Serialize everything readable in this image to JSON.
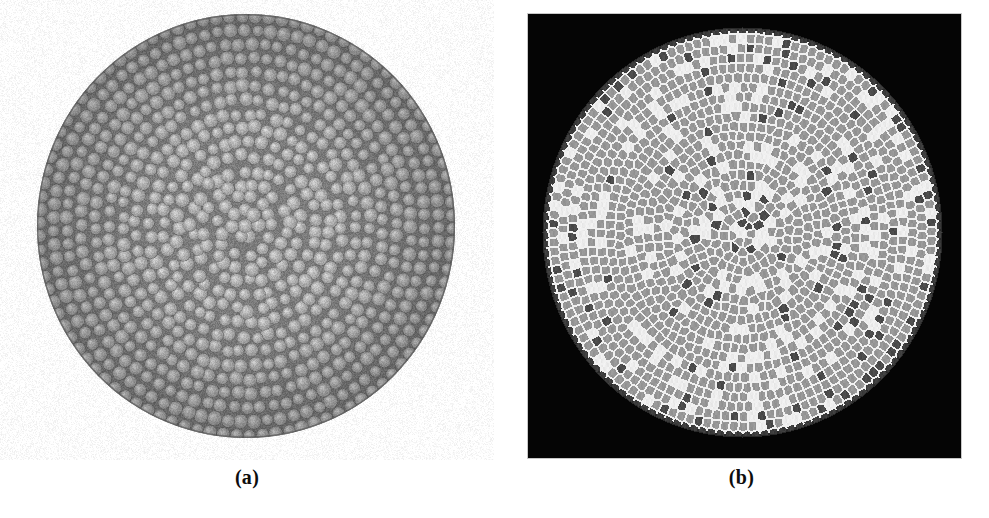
{
  "figure": {
    "background_color": "#ffffff",
    "width": 989,
    "height": 518
  },
  "panels": [
    {
      "id": "a",
      "caption": "(a)",
      "kind": "photograph",
      "description": "Grayscale micrograph of a monodisperse disc packing confined in a circular cell",
      "background_color": "#ffffff",
      "circle": {
        "cx": 246,
        "cy": 226,
        "rx": 209,
        "ry": 212
      },
      "disc": {
        "mean_radius": 6.6,
        "radius_jitter": 0.55,
        "fill_color": "#b4b4b4",
        "highlight_color": "#d2d2d2",
        "gap_color": "#6e6e6e",
        "edge_color": "#5a5a5a"
      },
      "matrix_color": "#7c7c7c",
      "rim_color": "#616161",
      "count_estimate": 2400,
      "shell_count": 16,
      "vignette_opacity": 0.18
    },
    {
      "id": "b",
      "caption": "(b)",
      "kind": "voronoi",
      "description": "Voronoi tessellation of the same packing, cells shaded by coordination number",
      "plate": {
        "left": 33,
        "top": 13,
        "width": 435,
        "height": 446
      },
      "background_color": "#050505",
      "plate_border_color": "#c8c8c8",
      "circle": {
        "cx": 214,
        "cy": 218,
        "rx": 200,
        "ry": 205
      },
      "edge_color": "#f0f0f0",
      "edge_width": 1.0,
      "cell_colors": {
        "six": "#969696",
        "seven": "#ececec",
        "five": "#4a4a4a",
        "boundary": "#3c3c3c"
      },
      "cell_legend": [
        {
          "key": "six",
          "coordination": 6,
          "color": "#969696",
          "label": "six-sided cell",
          "fraction": 0.72
        },
        {
          "key": "seven",
          "coordination": 7,
          "color": "#ececec",
          "label": "seven-sided cell",
          "fraction": 0.16
        },
        {
          "key": "five",
          "coordination": 5,
          "color": "#4a4a4a",
          "label": "five-sided cell",
          "fraction": 0.09
        },
        {
          "key": "boundary",
          "coordination": 0,
          "color": "#3c3c3c",
          "label": "boundary cell",
          "fraction": 0.03
        }
      ],
      "defect_core": {
        "cx": 214,
        "cy": 196,
        "radius": 52,
        "five_boost": 0.3,
        "seven_boost": 0.24
      },
      "count_estimate": 2400,
      "shell_count": 16
    }
  ],
  "chart_data": {
    "type": "heatmap",
    "title": "",
    "subtitle": "",
    "xlabel": "",
    "ylabel": "",
    "grid": false,
    "legend_position": "none",
    "panels": [
      "(a)",
      "(b)"
    ],
    "categories": [
      "six-sided",
      "seven-sided",
      "five-sided",
      "boundary"
    ],
    "values": [
      0.72,
      0.16,
      0.09,
      0.03
    ],
    "series": [
      {
        "name": "cell fraction (panel b)",
        "values": [
          0.72,
          0.16,
          0.09,
          0.03
        ]
      }
    ],
    "colors": [
      "#969696",
      "#ececec",
      "#4a4a4a",
      "#3c3c3c"
    ],
    "annotations": [
      "panel (a): experimental disc packing in a circular container",
      "panel (b): Voronoi tessellation shaded by coordination number",
      "disordered defect core near the centre of panel (b)"
    ]
  }
}
